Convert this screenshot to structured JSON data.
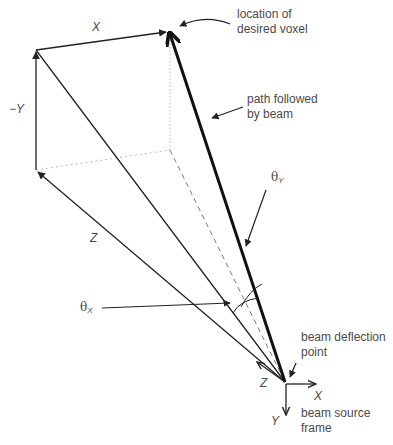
{
  "diagram": {
    "type": "geometric-vector-diagram",
    "labels": {
      "x_top": "X",
      "neg_y": "−Y",
      "z_left": "Z",
      "theta_y_symbol": "θ",
      "theta_y_sub": "Y",
      "theta_x_symbol": "θ",
      "theta_x_sub": "X",
      "voxel_line1": "location of",
      "voxel_line2": "desired voxel",
      "path_line1": "path followed",
      "path_line2": "by beam",
      "deflection_line1": "beam deflection",
      "deflection_line2": "point",
      "frame_z": "Z",
      "frame_x": "X",
      "frame_y": "Y",
      "frame_line1": "beam source",
      "frame_line2": "frame"
    },
    "colors": {
      "stroke": "#222222",
      "dashed": "#777777",
      "dotted": "#bbbbbb",
      "text": "#4a4a4a"
    }
  }
}
